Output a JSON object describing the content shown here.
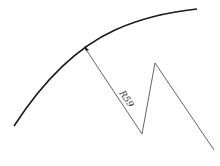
{
  "diagram": {
    "type": "radius-dimension",
    "dimension_label": "R59",
    "colors": {
      "arc": "#1a1a1a",
      "leader": "#555555",
      "text": "#333333",
      "background": "#ffffff"
    }
  }
}
